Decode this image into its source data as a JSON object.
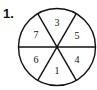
{
  "problem_number": "1.",
  "spinner": {
    "sectors": [
      {
        "position": "top",
        "label": "3"
      },
      {
        "position": "upper-right",
        "label": "5"
      },
      {
        "position": "lower-right",
        "label": "4"
      },
      {
        "position": "bottom",
        "label": "1"
      },
      {
        "position": "lower-left",
        "label": "6"
      },
      {
        "position": "upper-left",
        "label": "7"
      }
    ]
  }
}
